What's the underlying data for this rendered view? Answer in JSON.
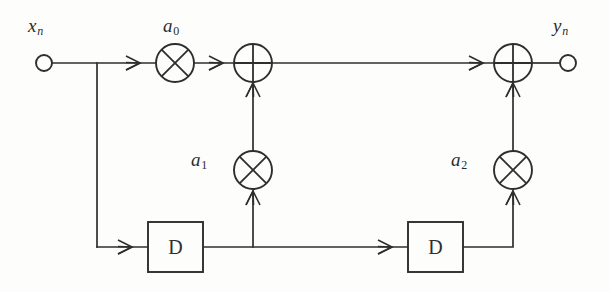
{
  "diagram": {
    "background_color": "#fdfdfc",
    "line_color": "#2e2e2e",
    "input": {
      "label_text": "x",
      "label_sub": "n",
      "node_name": "input-node"
    },
    "output": {
      "label_text": "y",
      "label_sub": "n",
      "node_name": "output-node"
    },
    "coefficients": [
      {
        "label_text": "a",
        "label_sub": "0",
        "name": "gain-a0"
      },
      {
        "label_text": "a",
        "label_sub": "1",
        "name": "gain-a1"
      },
      {
        "label_text": "a",
        "label_sub": "2",
        "name": "gain-a2"
      }
    ],
    "delays": [
      {
        "label": "D",
        "name": "delay-block-1"
      },
      {
        "label": "D",
        "name": "delay-block-2"
      }
    ],
    "adders": [
      {
        "glyph": "plus",
        "name": "summing-junction-1"
      },
      {
        "glyph": "plus",
        "name": "summing-junction-2"
      }
    ],
    "multiplier_glyph": "cross",
    "geometry": {
      "top_rail_y": 63,
      "bottom_rail_y": 247,
      "input_node_x": 44,
      "branch_x": 97,
      "mult_a0_x": 175,
      "sum1_x": 253,
      "mult_a1_x": 253,
      "sum2_x": 513,
      "mult_a2_x": 513,
      "output_node_x": 568,
      "mult_row_y": 170,
      "delay1_x": 148,
      "delay2_x": 408,
      "delay_y": 222,
      "delay_w": 55,
      "delay_h": 50,
      "circle_radius_mult": 19,
      "circle_radius_sum": 17,
      "node_radius": 8
    }
  }
}
